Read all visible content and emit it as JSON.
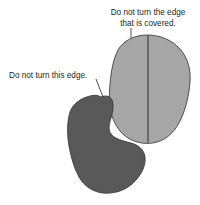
{
  "figure": {
    "background_color": "#ffffff",
    "annotations": [
      {
        "id": "covered-edge-note",
        "lines": [
          "Do not turn the edge",
          "that is covered."
        ],
        "line1": "Do not turn the edge",
        "line2": "that is covered.",
        "text_color": "#231f20",
        "align": "center",
        "leader": "vertical-line-down-to-light-shape"
      },
      {
        "id": "this-edge-note",
        "lines": [
          "Do not turn this edge."
        ],
        "line1": "Do not turn this edge.",
        "text_color": "#231f20",
        "align": "left",
        "leader": "diagonal-line-down-right-to-dark-shape"
      }
    ],
    "shapes": [
      {
        "id": "light-blob",
        "label": "light-gray-rounded-blob",
        "fill_color": "#a6a6a6",
        "stroke_color": "#404040",
        "divider": "vertical-line",
        "divider_color": "#231f20"
      },
      {
        "id": "dark-blob",
        "label": "dark-gray-notched-blob",
        "fill_color": "#595959",
        "stroke_color": "#3b3b3b",
        "overlaps": "light-blob"
      }
    ],
    "leader_line_color": "#231f20"
  }
}
